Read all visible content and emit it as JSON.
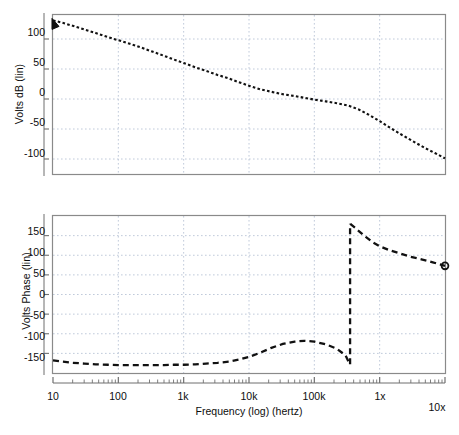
{
  "figure": {
    "background": "#ffffff",
    "frame_color": "#8a8a8a",
    "grid_color": "#b9c4d6",
    "curve_color": "#111111"
  },
  "chart_data": [
    {
      "id": "magnitude",
      "type": "line",
      "title": "",
      "xlabel": "",
      "ylabel": "Volts dB (lin)",
      "xscale": "log",
      "xlim": [
        10,
        10000000
      ],
      "ylim": [
        -125,
        140
      ],
      "grid": true,
      "xtick_labels": [
        "10",
        "100",
        "1k",
        "10k",
        "100k",
        "1x",
        "10x"
      ],
      "xtick_values": [
        10,
        100,
        1000,
        10000,
        100000,
        1000000,
        10000000
      ],
      "ytick_labels": [
        "100",
        "50",
        "0",
        "-50",
        "-100"
      ],
      "ytick_values": [
        100,
        50,
        0,
        -50,
        -100
      ],
      "x": [
        10,
        14,
        20,
        30,
        45,
        70,
        100,
        150,
        220,
        330,
        500,
        700,
        1000,
        1500,
        2200,
        3300,
        5000,
        7000,
        10000,
        15000,
        22000,
        33000,
        50000,
        70000,
        100000,
        150000,
        220000,
        330000,
        470000,
        700000,
        1000000,
        1500000,
        2200000,
        3300000,
        5000000,
        7000000,
        10000000
      ],
      "y": [
        131,
        127,
        122,
        116,
        110,
        103,
        98,
        92,
        86,
        79,
        72,
        66,
        60,
        53,
        47,
        40,
        34,
        28,
        22,
        16,
        12,
        8,
        5,
        2,
        -1,
        -4,
        -7,
        -11,
        -17,
        -27,
        -37,
        -49,
        -60,
        -71,
        -82,
        -90,
        -99
      ],
      "markers": [
        {
          "x": 10,
          "y": 131,
          "shape": "triangle"
        }
      ]
    },
    {
      "id": "phase",
      "type": "line",
      "title": "",
      "xlabel": "Frequency (log) (hertz)",
      "ylabel": "Volts Phase (lin)",
      "xscale": "log",
      "xlim": [
        10,
        10000000
      ],
      "ylim": [
        -200,
        200
      ],
      "grid": true,
      "xtick_labels": [
        "10",
        "100",
        "1k",
        "10k",
        "100k",
        "1x",
        "10x"
      ],
      "xtick_values": [
        10,
        100,
        1000,
        10000,
        100000,
        1000000,
        10000000
      ],
      "ytick_labels": [
        "150",
        "100",
        "50",
        "0",
        "-50",
        "-100",
        "-150"
      ],
      "ytick_values": [
        150,
        100,
        50,
        0,
        -50,
        -100,
        -150
      ],
      "segments": [
        {
          "x": [
            10,
            14,
            20,
            30,
            45,
            70,
            100,
            150,
            220,
            330,
            500,
            700,
            1000,
            1500,
            2200,
            3300,
            5000,
            7000,
            10000,
            15000,
            22000,
            33000,
            50000,
            70000,
            100000,
            150000,
            220000,
            300000,
            350000
          ],
          "y": [
            -168,
            -171,
            -174,
            -176,
            -178,
            -179,
            -180,
            -180,
            -180,
            -180,
            -180,
            -179,
            -179,
            -178,
            -176,
            -174,
            -171,
            -166,
            -159,
            -148,
            -136,
            -126,
            -120,
            -118,
            -120,
            -127,
            -138,
            -155,
            -178
          ]
        },
        {
          "x": [
            355000,
            420000,
            500000,
            620000,
            800000,
            1000000,
            1400000,
            2000000,
            3000000,
            4500000,
            6500000,
            10000000
          ],
          "y": [
            180,
            170,
            159,
            146,
            132,
            123,
            113,
            105,
            96,
            89,
            82,
            73
          ]
        }
      ],
      "markers": [
        {
          "x": 10000000,
          "y": 73,
          "shape": "circle"
        }
      ]
    }
  ],
  "caption": {
    "text": ""
  }
}
